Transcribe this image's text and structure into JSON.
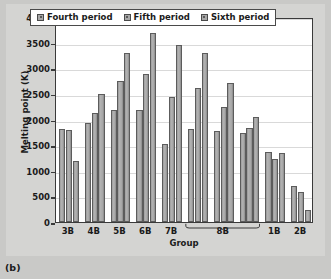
{
  "caption": "(b)",
  "legend": {
    "position": "top-inside",
    "entries": [
      {
        "label": "Fourth period",
        "icon": "legend-swatch-icon"
      },
      {
        "label": "Fifth period",
        "icon": "legend-swatch-icon"
      },
      {
        "label": "Sixth period",
        "icon": "legend-swatch-icon"
      }
    ]
  },
  "axes": {
    "y_title": "Melting point (K)",
    "x_title": "Group",
    "y_ticks": [
      "0",
      "500",
      "1000",
      "1500",
      "2000",
      "2500",
      "3000",
      "3500",
      "4000"
    ],
    "x_ticks": [
      "3B",
      "4B",
      "5B",
      "6B",
      "7B",
      "8B",
      "1B",
      "2B"
    ],
    "brace_label": "8B"
  },
  "chart_data": {
    "type": "bar",
    "title": "",
    "subtitle": "",
    "xlabel": "Group",
    "ylabel": "Melting point (K)",
    "ylim": [
      0,
      4000
    ],
    "ytick_values": [
      0,
      500,
      1000,
      1500,
      2000,
      2500,
      3000,
      3500,
      4000
    ],
    "grid": true,
    "legend_position": "top-inside",
    "categories": [
      "3B",
      "4B",
      "5B",
      "6B",
      "7B",
      "8B-1",
      "8B-2",
      "8B-3",
      "1B",
      "2B"
    ],
    "category_labels": [
      "3B",
      "4B",
      "5B",
      "6B",
      "7B",
      "8B",
      "8B",
      "8B",
      "1B",
      "2B"
    ],
    "series": [
      {
        "name": "Fourth period",
        "values": [
          1814,
          1941,
          2183,
          2180,
          1519,
          1811,
          1768,
          1728,
          1358,
          693
        ]
      },
      {
        "name": "Fifth period",
        "values": [
          1799,
          2128,
          2750,
          2896,
          2430,
          2607,
          2237,
          1828,
          1235,
          594
        ]
      },
      {
        "name": "Sixth period",
        "values": [
          1193,
          2506,
          3290,
          3695,
          3459,
          3306,
          2719,
          2041,
          1337,
          234
        ]
      }
    ]
  }
}
